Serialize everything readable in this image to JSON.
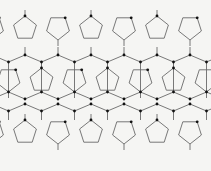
{
  "diagram": {
    "title": "",
    "kind": "polygon-tiling",
    "colors": {
      "background": "#f5f5f3",
      "edge": "#6a6a6a",
      "node": "#111111"
    },
    "lattice": {
      "period_x": 33,
      "x_start": 8,
      "columns": 7,
      "hex_bands": [
        {
          "top_y": 55,
          "bottom_y": 104,
          "zig": 7
        }
      ],
      "pentagon_bands": [
        {
          "center_y": 28,
          "height": 26
        },
        {
          "center_y": 79,
          "height": 26
        },
        {
          "center_y": 132,
          "height": 26
        }
      ],
      "hex_zig_rows": [
        {
          "y_high": 55,
          "y_low": 62
        },
        {
          "y_high": 104,
          "y_low": 111
        }
      ]
    }
  }
}
